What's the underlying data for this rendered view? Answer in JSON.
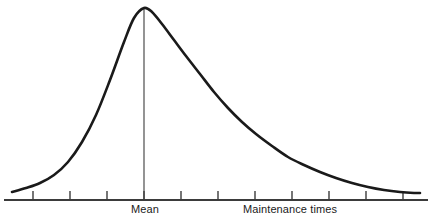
{
  "chart_data": {
    "type": "line",
    "title": "",
    "subtitle": "",
    "xlabel": "Maintenance times",
    "ylabel": "",
    "grid": false,
    "legend": null,
    "annotations": [
      {
        "name": "mean-line",
        "label": "Mean",
        "x": 3.0,
        "type": "vertical-line"
      }
    ],
    "axis": {
      "x_start_px": 4,
      "x_end_px": 428,
      "baseline_px": 200,
      "tick_count": 11,
      "tick_positions_px": [
        33,
        70,
        107,
        144,
        181,
        218,
        255,
        292,
        329,
        366,
        403
      ],
      "tick_labels": [
        "",
        "",
        "",
        "",
        "",
        "",
        "",
        "",
        "",
        "",
        ""
      ],
      "xlim": [
        0,
        11
      ],
      "ylim": [
        0,
        1
      ]
    },
    "x": [
      0.22,
      0.6,
      1.0,
      1.4,
      1.8,
      2.2,
      2.6,
      3.0,
      3.4,
      3.8,
      4.3,
      4.8,
      5.4,
      6.0,
      6.7,
      7.4,
      8.2,
      9.0,
      9.8,
      10.6,
      11.2
    ],
    "y": [
      0.042,
      0.06,
      0.095,
      0.165,
      0.28,
      0.45,
      0.68,
      1.0,
      0.95,
      0.85,
      0.72,
      0.6,
      0.48,
      0.38,
      0.29,
      0.22,
      0.16,
      0.115,
      0.085,
      0.065,
      0.055
    ],
    "curve_points_px": [
      [
        12,
        192
      ],
      [
        26,
        188
      ],
      [
        40,
        183
      ],
      [
        54,
        175
      ],
      [
        68,
        162
      ],
      [
        82,
        142
      ],
      [
        96,
        115
      ],
      [
        110,
        80
      ],
      [
        124,
        42
      ],
      [
        134,
        18
      ],
      [
        144,
        8
      ],
      [
        152,
        12
      ],
      [
        162,
        24
      ],
      [
        174,
        40
      ],
      [
        186,
        56
      ],
      [
        200,
        74
      ],
      [
        214,
        92
      ],
      [
        228,
        108
      ],
      [
        242,
        122
      ],
      [
        256,
        134
      ],
      [
        272,
        146
      ],
      [
        288,
        157
      ],
      [
        304,
        165
      ],
      [
        320,
        172
      ],
      [
        336,
        178
      ],
      [
        352,
        183
      ],
      [
        368,
        187
      ],
      [
        384,
        190
      ],
      [
        400,
        192
      ],
      [
        414,
        193
      ],
      [
        420,
        193
      ]
    ],
    "mean_line_px": {
      "x": 144,
      "y_top": 8,
      "y_bottom": 200
    }
  },
  "labels": {
    "mean": "Mean",
    "xaxis": "Maintenance times"
  },
  "colors": {
    "curve": "#1a1a1a",
    "axis": "#3b3b3b",
    "mean_line": "#3b3b3b",
    "background": "#ffffff",
    "text": "#1a1a1a"
  }
}
